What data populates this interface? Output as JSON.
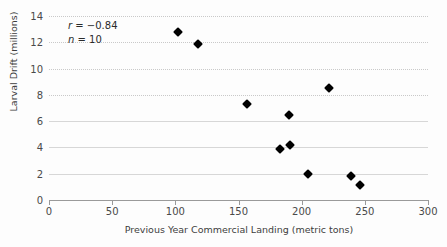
{
  "chart_data": {
    "type": "scatter",
    "title": "",
    "xlabel": "Previous Year Commercial Landing (metric tons)",
    "ylabel": "Larval Drift (millions)",
    "xlim": [
      0,
      300
    ],
    "ylim": [
      0,
      14
    ],
    "xticks": [
      0,
      50,
      100,
      150,
      200,
      250,
      300
    ],
    "yticks": [
      0,
      2,
      4,
      6,
      8,
      10,
      12,
      14
    ],
    "grid": "horizontal-dotted",
    "legend": "none",
    "marker": "filled-diamond",
    "marker_color": "#000000",
    "series": [
      {
        "name": "observations",
        "points": [
          {
            "x": 102,
            "y": 12.8
          },
          {
            "x": 118,
            "y": 11.9
          },
          {
            "x": 157,
            "y": 7.3
          },
          {
            "x": 183,
            "y": 3.85
          },
          {
            "x": 190,
            "y": 6.5
          },
          {
            "x": 191,
            "y": 4.15
          },
          {
            "x": 205,
            "y": 1.95
          },
          {
            "x": 222,
            "y": 8.5
          },
          {
            "x": 239,
            "y": 1.85
          },
          {
            "x": 246,
            "y": 1.15
          }
        ]
      }
    ],
    "annotations": [
      {
        "id": "correlation",
        "symbol": "r",
        "operator": "=",
        "value": "−0.84"
      },
      {
        "id": "sample-size",
        "symbol": "n",
        "operator": "=",
        "value": "10"
      }
    ]
  },
  "axis": {
    "x_tick_labels": [
      "0",
      "50",
      "100",
      "150",
      "200",
      "250",
      "300"
    ],
    "y_tick_labels": [
      "0",
      "2",
      "4",
      "6",
      "8",
      "10",
      "12",
      "14"
    ],
    "x_title": "Previous Year Commercial Landing (metric tons)",
    "y_title": "Larval Drift (millions)"
  },
  "annotation_lines": {
    "r_symbol": "r",
    "r_text": "= −0.84",
    "n_symbol": "n",
    "n_text": "= 10"
  },
  "colors": {
    "marker": "#000000",
    "grid": "#c9c9c9",
    "axis": "#9a9a9a",
    "text": "#4a4a4a",
    "background": "#fdfdfd"
  }
}
